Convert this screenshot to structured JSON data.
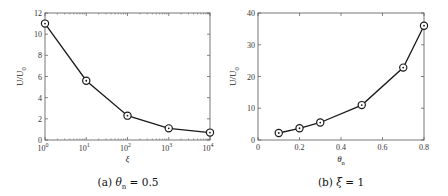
{
  "chart_data": [
    {
      "type": "line",
      "caption": "(a) θn = 0.5",
      "caption_prefix": "(a)",
      "caption_var": "θ",
      "caption_sub": "n",
      "caption_rest": " = 0.5",
      "xlabel": "ξ",
      "ylabel": "U/U0",
      "ylabel_main": "U/U",
      "ylabel_sub": "0",
      "xscale": "log",
      "xlim": [
        1,
        10000
      ],
      "ylim": [
        0,
        12
      ],
      "xticks": [
        "10",
        "10",
        "10",
        "10",
        "10"
      ],
      "xtick_exponents": [
        "0",
        "1",
        "2",
        "3",
        "4"
      ],
      "yticks": [
        "0",
        "2",
        "4",
        "6",
        "8",
        "10",
        "12"
      ],
      "x": [
        1,
        10,
        100,
        1000,
        10000
      ],
      "series": [
        {
          "name": "U/U0",
          "values": [
            11.0,
            5.6,
            2.3,
            1.1,
            0.7
          ],
          "marker": "circle-dot"
        }
      ]
    },
    {
      "type": "line",
      "caption": "(b) ξ = 1",
      "caption_prefix": "(b)",
      "caption_var": "ξ",
      "caption_rest": " = 1",
      "xlabel": "θn",
      "xlabel_main": "θ",
      "xlabel_sub": "n",
      "ylabel": "U/U0",
      "ylabel_main": "U/U",
      "ylabel_sub": "0",
      "xscale": "linear",
      "xlim": [
        0,
        0.8
      ],
      "ylim": [
        0,
        40
      ],
      "xticks": [
        "0",
        "0.2",
        "0.4",
        "0.6",
        "0.8"
      ],
      "yticks": [
        "0",
        "10",
        "20",
        "30",
        "40"
      ],
      "x": [
        0.1,
        0.2,
        0.3,
        0.5,
        0.7,
        0.8
      ],
      "series": [
        {
          "name": "U/U0",
          "values": [
            2.2,
            3.7,
            5.5,
            11.0,
            22.8,
            36.0
          ],
          "marker": "circle-dot"
        }
      ]
    }
  ],
  "colors": {
    "line": "#1a1a1a",
    "axis": "#555555"
  }
}
